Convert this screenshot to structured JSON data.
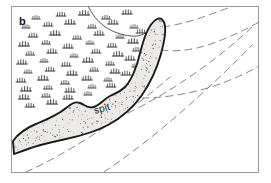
{
  "figure": {
    "panel_letter": "b",
    "labels": {
      "spit": "spit"
    },
    "colors": {
      "frame": "#9a9a9a",
      "background": "#ffffff",
      "outline": "#1a1a1a",
      "stipple_fill": "#e8e7e4",
      "stipple_dot": "#4a4a4a",
      "marsh_symbol": "#333333",
      "shoreline": "#555555",
      "contour_dashed": "#777777",
      "text": "#111111"
    },
    "frame": {
      "x": 11,
      "y": 6,
      "width": 248,
      "height": 167,
      "stroke_width": 1
    },
    "features": [
      {
        "name": "marsh",
        "kind": "symbol-field",
        "description": "vegetated marsh / tidal flat area with tuft symbols, upper left"
      },
      {
        "name": "spit",
        "kind": "stippled-landform",
        "description": "crescent-shaped recurved sand spit with stippled fill and heavy outline"
      },
      {
        "name": "shoreline",
        "kind": "thin-line",
        "description": "thin mainland shoreline entering from top edge"
      },
      {
        "name": "bathymetric-contours",
        "kind": "dashed-curves",
        "count": 4,
        "description": "dashed depth contours in the open water to the lower right"
      }
    ],
    "marsh_symbols": [
      [
        36,
        19
      ],
      [
        61,
        16
      ],
      [
        84,
        15
      ],
      [
        106,
        19
      ],
      [
        127,
        14
      ],
      [
        26,
        28
      ],
      [
        48,
        26
      ],
      [
        70,
        24
      ],
      [
        92,
        28
      ],
      [
        113,
        24
      ],
      [
        134,
        28
      ],
      [
        33,
        37
      ],
      [
        55,
        35
      ],
      [
        77,
        39
      ],
      [
        99,
        35
      ],
      [
        120,
        38
      ],
      [
        141,
        33
      ],
      [
        24,
        46
      ],
      [
        46,
        44
      ],
      [
        68,
        48
      ],
      [
        90,
        44
      ],
      [
        112,
        47
      ],
      [
        133,
        43
      ],
      [
        30,
        55
      ],
      [
        52,
        53
      ],
      [
        74,
        57
      ],
      [
        96,
        53
      ],
      [
        118,
        56
      ],
      [
        137,
        51
      ],
      [
        22,
        64
      ],
      [
        44,
        62
      ],
      [
        66,
        66
      ],
      [
        88,
        62
      ],
      [
        110,
        65
      ],
      [
        130,
        60
      ],
      [
        28,
        73
      ],
      [
        50,
        71
      ],
      [
        72,
        75
      ],
      [
        94,
        71
      ],
      [
        115,
        73
      ],
      [
        136,
        67
      ],
      [
        21,
        82
      ],
      [
        43,
        80
      ],
      [
        65,
        84
      ],
      [
        87,
        80
      ],
      [
        108,
        81
      ],
      [
        126,
        75
      ],
      [
        26,
        91
      ],
      [
        48,
        89
      ],
      [
        70,
        92
      ],
      [
        92,
        88
      ],
      [
        111,
        87
      ],
      [
        24,
        99
      ],
      [
        46,
        97
      ],
      [
        68,
        99
      ],
      [
        88,
        95
      ],
      [
        30,
        107
      ],
      [
        52,
        104
      ]
    ],
    "stipple_seed": 7,
    "stipple_density": 1300
  }
}
